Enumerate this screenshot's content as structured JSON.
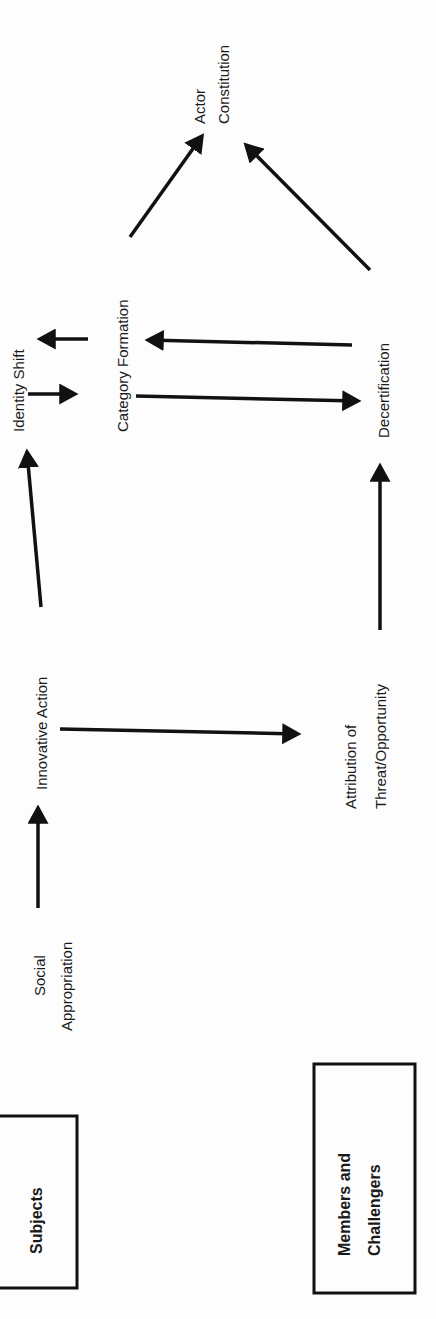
{
  "diagram": {
    "orientation": "rotated-90-ccw",
    "nodes": {
      "actor_constitution": {
        "line1": "Actor",
        "line2": "Constitution"
      },
      "identity_shift": {
        "label": "Identity Shift"
      },
      "category_formation": {
        "label": "Category Formation"
      },
      "decertification": {
        "label": "Decertification"
      },
      "innovative_action": {
        "label": "Innovative Action"
      },
      "attribution": {
        "line1": "Attribution of",
        "line2": "Threat/Opportunity"
      },
      "social_appropriation": {
        "line1": "Social",
        "line2": "Appropriation"
      }
    },
    "boxes": {
      "subjects": {
        "label": "Subjects"
      },
      "members": {
        "line1": "Members and",
        "line2": "Challengers"
      }
    },
    "edges": [
      {
        "from": "Social Appropriation",
        "to": "Innovative Action"
      },
      {
        "from": "Innovative Action",
        "to": "Identity Shift"
      },
      {
        "from": "Innovative Action",
        "to": "Attribution of Threat/Opportunity"
      },
      {
        "from": "Attribution of Threat/Opportunity",
        "to": "Decertification"
      },
      {
        "from": "Identity Shift",
        "to": "Category Formation"
      },
      {
        "from": "Category Formation",
        "to": "Identity Shift"
      },
      {
        "from": "Category Formation",
        "to": "Decertification"
      },
      {
        "from": "Decertification",
        "to": "Category Formation"
      },
      {
        "from": "Category Formation",
        "to": "Actor Constitution"
      },
      {
        "from": "Decertification",
        "to": "Actor Constitution"
      }
    ],
    "colors": {
      "ink": "#111111",
      "background": "#fdfdfd"
    }
  }
}
